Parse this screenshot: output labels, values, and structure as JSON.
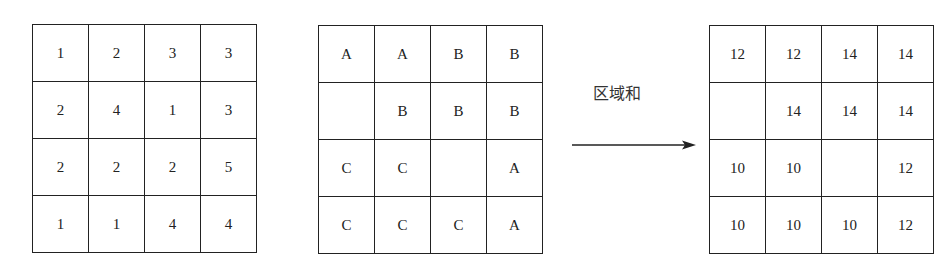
{
  "diagram": {
    "value_grid": {
      "rows": [
        [
          "1",
          "2",
          "3",
          "3"
        ],
        [
          "2",
          "4",
          "1",
          "3"
        ],
        [
          "2",
          "2",
          "2",
          "5"
        ],
        [
          "1",
          "1",
          "4",
          "4"
        ]
      ]
    },
    "region_grid": {
      "rows": [
        [
          "A",
          "A",
          "B",
          "B"
        ],
        [
          "",
          "B",
          "B",
          "B"
        ],
        [
          "C",
          "C",
          "",
          "A"
        ],
        [
          "C",
          "C",
          "C",
          "A"
        ]
      ]
    },
    "arrow_label": "区域和",
    "sum_grid": {
      "rows": [
        [
          "12",
          "12",
          "14",
          "14"
        ],
        [
          "",
          "14",
          "14",
          "14"
        ],
        [
          "10",
          "10",
          "",
          "12"
        ],
        [
          "10",
          "10",
          "10",
          "12"
        ]
      ]
    }
  }
}
